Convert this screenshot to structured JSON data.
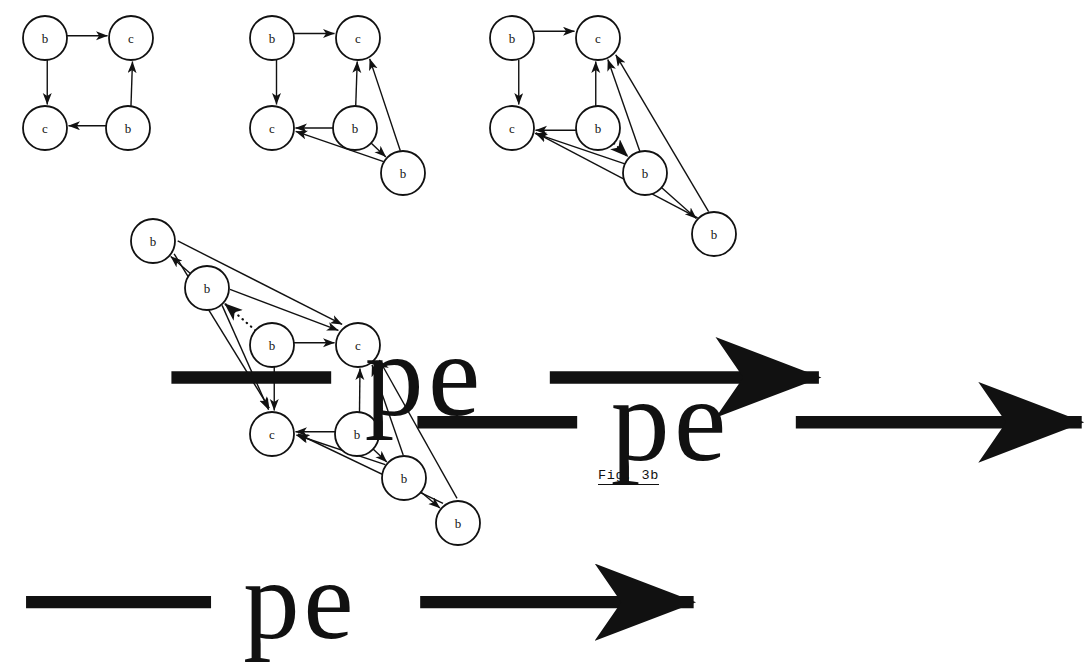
{
  "figure": {
    "caption": "Fig. 3b",
    "node_labels": {
      "b": "b",
      "c": "c"
    },
    "transition_label": "pe",
    "transitions": [
      {
        "id": "t1",
        "label": "pe"
      },
      {
        "id": "t2",
        "label": "pe"
      },
      {
        "id": "t3",
        "label": "pe"
      }
    ]
  },
  "chart_data": {
    "type": "diagram",
    "title": "Fig. 3b",
    "graphs": [
      {
        "id": "graph-1",
        "nodes": [
          {
            "id": "g1n1",
            "label": "b",
            "x": 45,
            "y": 38
          },
          {
            "id": "g1n2",
            "label": "c",
            "x": 131,
            "y": 38
          },
          {
            "id": "g1n3",
            "label": "c",
            "x": 45,
            "y": 128
          },
          {
            "id": "g1n4",
            "label": "b",
            "x": 128,
            "y": 128
          }
        ],
        "edges": [
          {
            "from": "g1n1",
            "to": "g1n2",
            "style": "solid"
          },
          {
            "from": "g1n1",
            "to": "g1n3",
            "style": "solid"
          },
          {
            "from": "g1n4",
            "to": "g1n3",
            "style": "solid"
          },
          {
            "from": "g1n4",
            "to": "g1n2",
            "style": "solid"
          }
        ]
      },
      {
        "id": "graph-2",
        "nodes": [
          {
            "id": "g2n1",
            "label": "b",
            "x": 272,
            "y": 38
          },
          {
            "id": "g2n2",
            "label": "c",
            "x": 358,
            "y": 38
          },
          {
            "id": "g2n3",
            "label": "c",
            "x": 272,
            "y": 128
          },
          {
            "id": "g2n4",
            "label": "b",
            "x": 355,
            "y": 128
          },
          {
            "id": "g2n5",
            "label": "b",
            "x": 403,
            "y": 173
          }
        ],
        "edges": [
          {
            "from": "g2n1",
            "to": "g2n2",
            "style": "solid"
          },
          {
            "from": "g2n1",
            "to": "g2n3",
            "style": "solid"
          },
          {
            "from": "g2n4",
            "to": "g2n3",
            "style": "solid"
          },
          {
            "from": "g2n4",
            "to": "g2n2",
            "style": "solid"
          },
          {
            "from": "g2n4",
            "to": "g2n5",
            "style": "solid"
          },
          {
            "from": "g2n5",
            "to": "g2n3",
            "style": "solid"
          },
          {
            "from": "g2n5",
            "to": "g2n2",
            "style": "solid"
          }
        ]
      },
      {
        "id": "graph-3",
        "nodes": [
          {
            "id": "g3n1",
            "label": "b",
            "x": 512,
            "y": 38
          },
          {
            "id": "g3n2",
            "label": "c",
            "x": 598,
            "y": 38
          },
          {
            "id": "g3n3",
            "label": "c",
            "x": 512,
            "y": 128
          },
          {
            "id": "g3n4",
            "label": "b",
            "x": 598,
            "y": 128
          },
          {
            "id": "g3n5",
            "label": "b",
            "x": 645,
            "y": 173
          },
          {
            "id": "g3n6",
            "label": "b",
            "x": 714,
            "y": 234
          }
        ],
        "edges": [
          {
            "from": "g3n1",
            "to": "g3n2",
            "style": "solid"
          },
          {
            "from": "g3n1",
            "to": "g3n3",
            "style": "solid"
          },
          {
            "from": "g3n4",
            "to": "g3n3",
            "style": "solid"
          },
          {
            "from": "g3n4",
            "to": "g3n2",
            "style": "solid"
          },
          {
            "from": "g3n4",
            "to": "g3n5",
            "style": "dotted"
          },
          {
            "from": "g3n5",
            "to": "g3n3",
            "style": "solid"
          },
          {
            "from": "g3n5",
            "to": "g3n2",
            "style": "solid"
          },
          {
            "from": "g3n5",
            "to": "g3n6",
            "style": "solid"
          },
          {
            "from": "g3n6",
            "to": "g3n3",
            "style": "solid"
          },
          {
            "from": "g3n6",
            "to": "g3n2",
            "style": "solid"
          }
        ]
      },
      {
        "id": "graph-4",
        "nodes": [
          {
            "id": "g4n1",
            "label": "b",
            "x": 153,
            "y": 241
          },
          {
            "id": "g4n2",
            "label": "b",
            "x": 207,
            "y": 288
          },
          {
            "id": "g4n3",
            "label": "b",
            "x": 272,
            "y": 345
          },
          {
            "id": "g4n4",
            "label": "c",
            "x": 358,
            "y": 345
          },
          {
            "id": "g4n5",
            "label": "c",
            "x": 272,
            "y": 434
          },
          {
            "id": "g4n6",
            "label": "b",
            "x": 357,
            "y": 434
          },
          {
            "id": "g4n7",
            "label": "b",
            "x": 404,
            "y": 478
          },
          {
            "id": "g4n8",
            "label": "b",
            "x": 458,
            "y": 523
          }
        ],
        "edges": [
          {
            "from": "g4n1",
            "to": "g4n4",
            "style": "solid"
          },
          {
            "from": "g4n1",
            "to": "g4n5",
            "style": "solid"
          },
          {
            "from": "g4n2",
            "to": "g4n1",
            "style": "solid"
          },
          {
            "from": "g4n2",
            "to": "g4n4",
            "style": "solid"
          },
          {
            "from": "g4n2",
            "to": "g4n5",
            "style": "solid"
          },
          {
            "from": "g4n3",
            "to": "g4n2",
            "style": "dotted"
          },
          {
            "from": "g4n3",
            "to": "g4n4",
            "style": "solid"
          },
          {
            "from": "g4n3",
            "to": "g4n5",
            "style": "solid"
          },
          {
            "from": "g4n6",
            "to": "g4n5",
            "style": "solid"
          },
          {
            "from": "g4n6",
            "to": "g4n4",
            "style": "solid"
          },
          {
            "from": "g4n6",
            "to": "g4n7",
            "style": "solid"
          },
          {
            "from": "g4n7",
            "to": "g4n5",
            "style": "solid"
          },
          {
            "from": "g4n7",
            "to": "g4n4",
            "style": "solid"
          },
          {
            "from": "g4n7",
            "to": "g4n8",
            "style": "solid"
          },
          {
            "from": "g4n8",
            "to": "g4n5",
            "style": "solid"
          },
          {
            "from": "g4n8",
            "to": "g4n4",
            "style": "solid"
          }
        ]
      }
    ],
    "node_radius": 22
  }
}
